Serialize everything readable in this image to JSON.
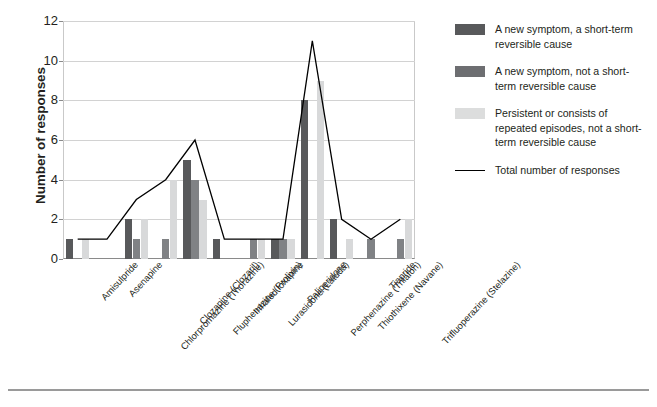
{
  "chart_data": {
    "type": "bar",
    "title": "",
    "xlabel": "",
    "ylabel": "Number of responses",
    "ylim": [
      0,
      12
    ],
    "ytick_values": [
      0,
      2,
      4,
      6,
      8,
      10,
      12
    ],
    "ytick_labels": [
      "0",
      "2",
      "4",
      "6",
      "8",
      "10",
      "12"
    ],
    "grid": true,
    "legend_position": "right",
    "categories": [
      "Amisulpride",
      "Asenapine",
      "Chlorpromazine (Thorazine)",
      "Clozapine (Clozaril)",
      "Fluphenazine (Prolixin)",
      "Inhaled loxapine",
      "Lurasidone (Latuda)",
      "Paliperidone",
      "Perphenazine (Trilafon)",
      "Thiothixene (Navane)",
      "Tiapride",
      "Trifluoperazine (Stelazine)"
    ],
    "series": [
      {
        "name": "A new symptom, a short-term reversible cause",
        "kind": "bar",
        "color": "#58595b",
        "values": [
          1,
          0,
          2,
          0,
          5,
          1,
          0,
          1,
          8,
          2,
          0,
          0
        ]
      },
      {
        "name": "A new symptom, not a short-term reversible cause",
        "kind": "bar",
        "color": "#808285",
        "values": [
          0,
          0,
          1,
          1,
          4,
          0,
          1,
          1,
          0,
          0,
          1,
          1
        ]
      },
      {
        "name": "Persistent or consists of repeated episodes, not a short-term reversible cause",
        "kind": "bar",
        "color": "#d8d9da",
        "values": [
          1,
          0,
          2,
          4,
          3,
          0,
          1,
          1,
          9,
          1,
          0,
          2
        ]
      },
      {
        "name": "Total number of responses",
        "kind": "line",
        "color": "#000000",
        "values": [
          1,
          1,
          3,
          4,
          6,
          1,
          1,
          1,
          11,
          2,
          1,
          2
        ]
      }
    ]
  },
  "legend": {
    "entries": [
      {
        "label": "A new symptom, a short-term reversible cause",
        "swatch": "dark-gray-swatch"
      },
      {
        "label": "A new symptom, not a short-term reversible cause",
        "swatch": "medium-gray-swatch"
      },
      {
        "label": "Persistent or consists of repeated episodes, not a short-term reversible cause",
        "swatch": "light-gray-swatch"
      },
      {
        "label": "Total number of responses",
        "swatch": "black-line-swatch"
      }
    ]
  },
  "colors": {
    "series_dark": "#58595b",
    "series_medium": "#808285",
    "series_light": "#d8d9da",
    "line": "#000000",
    "gridline": "#d2d2d2",
    "axis": "#8a8a8a",
    "text": "#231f20"
  }
}
